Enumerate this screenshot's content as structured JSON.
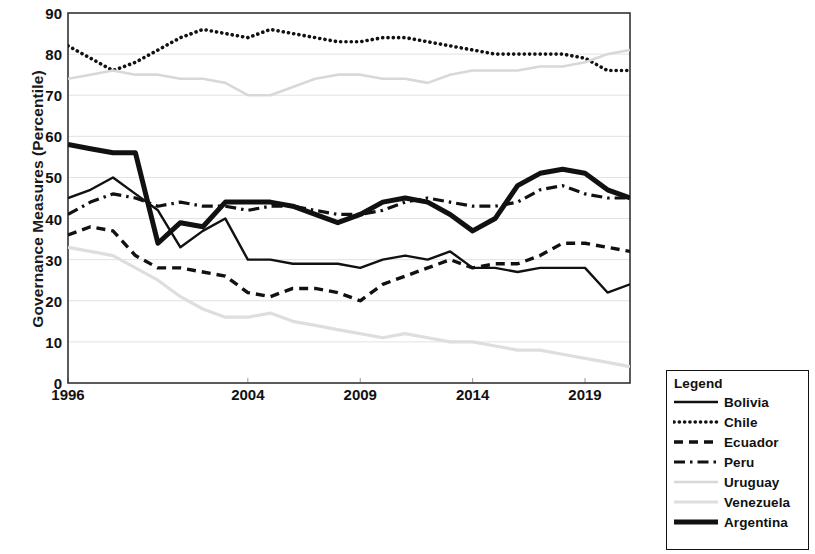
{
  "chart_data": {
    "type": "line",
    "title": "",
    "xlabel": "",
    "ylabel": "Governance Measures (Percentile)",
    "ylim": [
      0,
      90
    ],
    "ytick_labels": [
      "0",
      "10",
      "20",
      "30",
      "40",
      "50",
      "60",
      "70",
      "80",
      "90"
    ],
    "ytick_values": [
      0,
      10,
      20,
      30,
      40,
      50,
      60,
      70,
      80,
      90
    ],
    "xtick_labels": [
      "1996",
      "2004",
      "2009",
      "2014",
      "2019"
    ],
    "xtick_values": [
      1996,
      2004,
      2009,
      2014,
      2019
    ],
    "xlim": [
      1996,
      2021
    ],
    "grid": "horizontal",
    "legend_position": "outside-bottom-right",
    "legend_title": "Legend",
    "x": [
      1996,
      1997,
      1998,
      1999,
      2000,
      2001,
      2002,
      2003,
      2004,
      2005,
      2006,
      2007,
      2008,
      2009,
      2010,
      2011,
      2012,
      2013,
      2014,
      2015,
      2016,
      2017,
      2018,
      2019,
      2020,
      2021
    ],
    "series": [
      {
        "name": "Bolivia",
        "style": "solid-thin",
        "color": "#111111",
        "values": [
          45,
          47,
          50,
          46,
          42,
          33,
          37,
          40,
          30,
          30,
          29,
          29,
          29,
          28,
          30,
          31,
          30,
          32,
          28,
          28,
          27,
          28,
          28,
          28,
          22,
          24
        ]
      },
      {
        "name": "Chile",
        "style": "dotted",
        "color": "#111111",
        "values": [
          82,
          79,
          76,
          78,
          81,
          84,
          86,
          85,
          84,
          86,
          85,
          84,
          83,
          83,
          84,
          84,
          83,
          82,
          81,
          80,
          80,
          80,
          80,
          79,
          76,
          76
        ]
      },
      {
        "name": "Ecuador",
        "style": "dashed",
        "color": "#111111",
        "values": [
          36,
          38,
          37,
          31,
          28,
          28,
          27,
          26,
          22,
          21,
          23,
          23,
          22,
          20,
          24,
          26,
          28,
          30,
          28,
          29,
          29,
          31,
          34,
          34,
          33,
          32
        ]
      },
      {
        "name": "Peru",
        "style": "dash-dot",
        "color": "#111111",
        "values": [
          41,
          44,
          46,
          45,
          43,
          44,
          43,
          43,
          42,
          43,
          43,
          42,
          41,
          41,
          42,
          44,
          45,
          44,
          43,
          43,
          44,
          47,
          48,
          46,
          45,
          45
        ]
      },
      {
        "name": "Uruguay",
        "style": "solid-lightgray",
        "color": "#d5d5d5",
        "values": [
          74,
          75,
          76,
          75,
          75,
          74,
          74,
          73,
          70,
          70,
          72,
          74,
          75,
          75,
          74,
          74,
          73,
          75,
          76,
          76,
          76,
          77,
          77,
          78,
          80,
          81
        ]
      },
      {
        "name": "Venezuela",
        "style": "solid-gray",
        "color": "#dcdcdc",
        "values": [
          33,
          32,
          31,
          28,
          25,
          21,
          18,
          16,
          16,
          17,
          15,
          14,
          13,
          12,
          11,
          12,
          11,
          10,
          10,
          9,
          8,
          8,
          7,
          6,
          5,
          4
        ]
      },
      {
        "name": "Argentina",
        "style": "solid-thick",
        "color": "#111111",
        "values": [
          58,
          57,
          56,
          56,
          34,
          39,
          38,
          44,
          44,
          44,
          43,
          41,
          39,
          41,
          44,
          45,
          44,
          41,
          37,
          40,
          48,
          51,
          52,
          51,
          47,
          45
        ]
      }
    ]
  },
  "legend": {
    "title": "Legend",
    "items": [
      {
        "label": "Bolivia",
        "swatch": "solid-thin"
      },
      {
        "label": "Chile",
        "swatch": "dotted"
      },
      {
        "label": "Ecuador",
        "swatch": "dashed"
      },
      {
        "label": "Peru",
        "swatch": "dash-dot"
      },
      {
        "label": "Uruguay",
        "swatch": "solid-lightgray"
      },
      {
        "label": "Venezuela",
        "swatch": "solid-gray"
      },
      {
        "label": "Argentina",
        "swatch": "solid-thick"
      }
    ]
  }
}
